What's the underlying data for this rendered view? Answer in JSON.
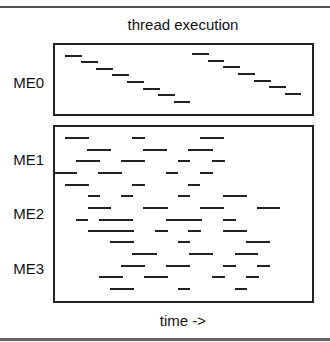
{
  "diagram": {
    "title": "thread execution",
    "x_axis_label": "time ->",
    "colors": {
      "dash": "#222222",
      "frame": "#222222",
      "rule": "#555555"
    },
    "panels": [
      {
        "id": "me0",
        "labels": [
          {
            "text": "ME0",
            "y": 82
          }
        ],
        "dashes": [
          [
            65,
            56,
            82
          ],
          [
            81,
            62,
            98
          ],
          [
            96,
            69,
            113
          ],
          [
            112,
            75,
            129
          ],
          [
            127,
            82,
            144
          ],
          [
            143,
            89,
            160
          ],
          [
            158,
            95,
            175
          ],
          [
            174,
            102,
            190
          ],
          [
            192,
            54,
            209
          ],
          [
            208,
            61,
            224
          ],
          [
            223,
            67,
            240
          ],
          [
            238,
            74,
            255
          ],
          [
            254,
            81,
            271
          ],
          [
            269,
            87,
            286
          ],
          [
            285,
            94,
            301
          ]
        ]
      },
      {
        "id": "lower",
        "labels": [
          {
            "text": "ME1",
            "y": 159
          },
          {
            "text": "ME2",
            "y": 213
          },
          {
            "text": "ME3",
            "y": 268
          }
        ],
        "dashes": [
          [
            65,
            138,
            89
          ],
          [
            132,
            138,
            145
          ],
          [
            200,
            138,
            224
          ],
          [
            87,
            150,
            111
          ],
          [
            143,
            150,
            167
          ],
          [
            188,
            150,
            213
          ],
          [
            76,
            161,
            100
          ],
          [
            121,
            161,
            145
          ],
          [
            178,
            161,
            190
          ],
          [
            212,
            161,
            225
          ],
          [
            53,
            173,
            77
          ],
          [
            98,
            173,
            122
          ],
          [
            166,
            173,
            178
          ],
          [
            200,
            173,
            213
          ],
          [
            65,
            185,
            89
          ],
          [
            132,
            185,
            145
          ],
          [
            188,
            185,
            200
          ],
          [
            88,
            196,
            100
          ],
          [
            121,
            196,
            133
          ],
          [
            178,
            196,
            190
          ],
          [
            223,
            196,
            247
          ],
          [
            88,
            208,
            111
          ],
          [
            143,
            208,
            168
          ],
          [
            200,
            208,
            224
          ],
          [
            257,
            208,
            280
          ],
          [
            76,
            220,
            88
          ],
          [
            99,
            220,
            133
          ],
          [
            166,
            220,
            202
          ],
          [
            223,
            220,
            236
          ],
          [
            88,
            231,
            134
          ],
          [
            155,
            231,
            168
          ],
          [
            188,
            231,
            201
          ],
          [
            223,
            231,
            247
          ],
          [
            110,
            242,
            134
          ],
          [
            178,
            242,
            190
          ],
          [
            246,
            242,
            270
          ],
          [
            132,
            254,
            157
          ],
          [
            189,
            254,
            213
          ],
          [
            235,
            254,
            258
          ],
          [
            121,
            266,
            145
          ],
          [
            166,
            266,
            190
          ],
          [
            223,
            266,
            236
          ],
          [
            257,
            266,
            270
          ],
          [
            99,
            277,
            123
          ],
          [
            144,
            277,
            168
          ],
          [
            212,
            277,
            225
          ],
          [
            246,
            277,
            259
          ],
          [
            110,
            289,
            134
          ],
          [
            178,
            289,
            190
          ],
          [
            235,
            289,
            247
          ]
        ]
      }
    ]
  }
}
